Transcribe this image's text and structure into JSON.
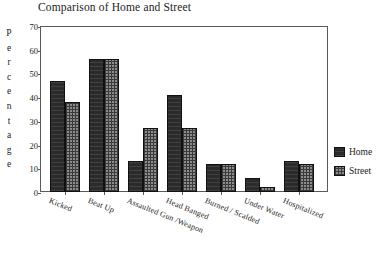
{
  "chart_data": {
    "type": "bar",
    "title": "Comparison of Home and Street",
    "xlabel": "",
    "ylabel": "Percentage",
    "ylim": [
      0,
      70
    ],
    "yticks": [
      0,
      10,
      20,
      30,
      40,
      50,
      60,
      70
    ],
    "grid": false,
    "legend_position": "right",
    "categories": [
      "Kicked",
      "Beat Up",
      "Assaulted Gun /Weapon",
      "Head Banged",
      "Burned / Scalded",
      "Under Water",
      "Hospitalized"
    ],
    "series": [
      {
        "name": "Home",
        "color": "#2b2b2b",
        "values": [
          47,
          56,
          13,
          41,
          12,
          6,
          13
        ]
      },
      {
        "name": "Street",
        "color": "#8c8c8c",
        "values": [
          38,
          56,
          27,
          27,
          12,
          2,
          12
        ]
      }
    ]
  },
  "ylabel_letters": [
    "P",
    "e",
    "r",
    "c",
    "e",
    "n",
    "t",
    "a",
    "g",
    "e"
  ]
}
